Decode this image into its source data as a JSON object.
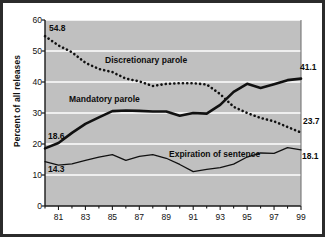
{
  "chart_data": {
    "type": "line",
    "title": "",
    "subtitle": "",
    "xlabel": "",
    "ylabel": "Percent of all releases",
    "xlim": [
      1980,
      1999
    ],
    "ylim": [
      0,
      60
    ],
    "yticks": [
      0,
      10,
      20,
      30,
      40,
      50,
      60
    ],
    "ytick_labels": [
      "0",
      "10",
      "20",
      "30",
      "40",
      "50",
      "60"
    ],
    "x": [
      1980,
      1981,
      1982,
      1983,
      1984,
      1985,
      1986,
      1987,
      1988,
      1989,
      1990,
      1991,
      1992,
      1993,
      1994,
      1995,
      1996,
      1997,
      1998,
      1999
    ],
    "xticks": [
      1981,
      1983,
      1985,
      1987,
      1989,
      1991,
      1993,
      1995,
      1997,
      1999
    ],
    "xtick_labels": [
      "81",
      "83",
      "85",
      "87",
      "89",
      "91",
      "93",
      "95",
      "97",
      "99"
    ],
    "minor_xticks_every_year": true,
    "grid": "horizontal-white",
    "legend_position": "inline-annotations",
    "plot_background": "#c0c0c0",
    "series": [
      {
        "name": "Discretionary parole",
        "style": "dotted",
        "width": 2.6,
        "color": "#111111",
        "values": [
          54.8,
          51.8,
          49.6,
          46.2,
          44.2,
          43.2,
          41.1,
          40.2,
          38.7,
          39.4,
          39.6,
          39.6,
          39.2,
          36.1,
          32.0,
          30.0,
          28.4,
          27.3,
          25.5,
          23.7
        ],
        "start_label": "54.8",
        "end_label": "23.7"
      },
      {
        "name": "Mandatory parole",
        "style": "solid",
        "width": 2.6,
        "color": "#111111",
        "values": [
          18.6,
          20.3,
          23.6,
          26.5,
          28.6,
          30.6,
          30.8,
          30.7,
          30.5,
          30.5,
          29.1,
          30.0,
          29.8,
          32.6,
          36.8,
          39.4,
          38.1,
          39.3,
          40.6,
          41.1
        ],
        "start_label": "18.6",
        "end_label": "41.1"
      },
      {
        "name": "Expiration of sentence",
        "style": "solid",
        "width": 1.3,
        "color": "#111111",
        "values": [
          14.3,
          13.2,
          13.6,
          14.7,
          15.8,
          16.6,
          14.7,
          16.0,
          16.6,
          15.4,
          13.4,
          11.1,
          11.8,
          12.4,
          13.5,
          15.8,
          17.1,
          17.0,
          18.8,
          18.1
        ],
        "start_label": "14.3",
        "end_label": "18.1"
      }
    ],
    "annotations": [
      {
        "text": "Discretionary parole",
        "series": "Discretionary parole"
      },
      {
        "text": "Mandatory parole",
        "series": "Mandatory parole"
      },
      {
        "text": "Expiration of sentence",
        "series": "Expiration of sentence"
      }
    ]
  }
}
